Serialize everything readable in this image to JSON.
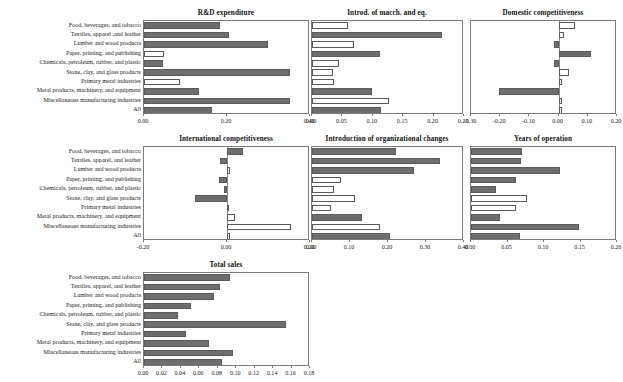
{
  "figure": {
    "categories": [
      "Food, beverages, and tobacco",
      "Textiles, apparel ,and leather",
      "Lumber and wood products",
      "Paper, printing, and publishing",
      "Chemicals, petroleum, rubber, and plastic",
      "Stone, clay, and glass products",
      "Primary metal industries",
      "Metal products, machinery, and equipment",
      "Miscellaneous manufacturing industries",
      "All"
    ],
    "categories_alt": [
      "Food, beverages, and tobacco",
      "Textiles, apparel, and leather",
      "Lumber and wood products",
      "Paper, printing, and publishing",
      "Chemicals, petroleum, rubber, and plastic",
      "Stone, clay, and glass products",
      "Primary metal industries",
      "Metal products, machinery, and equipment",
      "Miscellaneous manufacturing industries",
      "All"
    ],
    "colors": {
      "filled": "#6e6e6e",
      "hollow": "#ffffff",
      "outline": "#5a5a5a",
      "axis": "#7a7a7a",
      "text": "#1a1a1a"
    }
  },
  "chart_data": [
    {
      "id": "rd-expenditure",
      "type": "bar",
      "orientation": "horizontal",
      "title": "R&D expenditure",
      "xlabel": "",
      "ylabel": "",
      "xlim": [
        0.0,
        0.4
      ],
      "ticks": [
        "0.00",
        "0.20",
        "0.40"
      ],
      "tickvals": [
        0.0,
        0.2,
        0.4
      ],
      "grid": false,
      "categories": [
        "Food, beverages, and tobacco",
        "Textiles, apparel ,and leather",
        "Lumber and wood products",
        "Paper, printing, and publishing",
        "Chemicals, petroleum, rubber, and plastic",
        "Stone, clay, and glass products",
        "Primary metal industries",
        "Metal products, machinery, and equipment",
        "Miscellaneous manufacturing industries",
        "All"
      ],
      "values": [
        0.182,
        0.205,
        0.298,
        0.048,
        0.046,
        0.352,
        0.087,
        0.132,
        0.351,
        0.165
      ],
      "filled": [
        true,
        true,
        true,
        false,
        true,
        true,
        false,
        true,
        true,
        true
      ]
    },
    {
      "id": "introd-macch-eq",
      "type": "bar",
      "orientation": "horizontal",
      "title": "Introd. of macch. and eq.",
      "xlabel": "",
      "ylabel": "",
      "xlim": [
        0.0,
        0.25
      ],
      "ticks": [
        "0.00",
        "0.05",
        "0.10",
        "0.15",
        "0.20",
        "0.25"
      ],
      "tickvals": [
        0.0,
        0.05,
        0.1,
        0.15,
        0.2,
        0.25
      ],
      "grid": false,
      "categories": [
        "Food, beverages, and tobacco",
        "Textiles, apparel ,and leather",
        "Lumber and wood products",
        "Paper, printing, and publishing",
        "Chemicals, petroleum, rubber, and plastic",
        "Stone, clay, and glass products",
        "Primary metal industries",
        "Metal products, machinery, and equipment",
        "Miscellaneous manufacturing industries",
        "All"
      ],
      "values": [
        0.06,
        0.214,
        0.069,
        0.112,
        0.044,
        0.034,
        0.036,
        0.099,
        0.126,
        0.113
      ],
      "filled": [
        false,
        true,
        false,
        true,
        false,
        false,
        false,
        true,
        false,
        true
      ]
    },
    {
      "id": "domestic-competitiveness",
      "type": "bar",
      "orientation": "horizontal",
      "title": "Domestic competitiveness",
      "xlabel": "",
      "ylabel": "",
      "xlim": [
        -0.3,
        0.2
      ],
      "ticks": [
        "-0.30",
        "-0.20",
        "-0.10",
        "0.00",
        "0.10",
        "0.20"
      ],
      "tickvals": [
        -0.3,
        -0.2,
        -0.1,
        0.0,
        0.1,
        0.2
      ],
      "grid": false,
      "categories": [
        "Food, beverages, and tobacco",
        "Textiles, apparel ,and leather",
        "Lumber and wood products",
        "Paper, printing, and publishing",
        "Chemicals, petroleum, rubber, and plastic",
        "Stone, clay, and glass products",
        "Primary metal industries",
        "Metal products, machinery, and equipment",
        "Miscellaneous manufacturing industries",
        "All"
      ],
      "values": [
        0.056,
        0.02,
        -0.016,
        0.11,
        -0.016,
        0.035,
        0.01,
        -0.205,
        0.01,
        0.01
      ],
      "filled": [
        false,
        false,
        true,
        true,
        true,
        false,
        false,
        true,
        false,
        false
      ]
    },
    {
      "id": "international-competitiveness",
      "type": "bar",
      "orientation": "horizontal",
      "title": "International competitiveness",
      "xlabel": "",
      "ylabel": "",
      "xlim": [
        -0.2,
        0.2
      ],
      "ticks": [
        "-0.20",
        "0.00",
        "0.20"
      ],
      "tickvals": [
        -0.2,
        0.0,
        0.2
      ],
      "grid": false,
      "categories": [
        "Food, beverages, and tobacco",
        "Textiles, apparel, and leather",
        "Lumber and wood products",
        "Paper, printing, and publishing",
        "Chemicals, petroleum, rubber, and plastic",
        "Stone, clay, and glass products",
        "Primary metal industries",
        "Metal products, machinery, and equipment",
        "Miscellaneous manufacturing industries",
        "All"
      ],
      "values": [
        0.038,
        -0.018,
        0.008,
        -0.02,
        -0.008,
        -0.076,
        0.006,
        0.02,
        0.155,
        0.008
      ],
      "filled": [
        true,
        true,
        false,
        true,
        true,
        true,
        false,
        false,
        false,
        false
      ]
    },
    {
      "id": "organizational-changes",
      "type": "bar",
      "orientation": "horizontal",
      "title": "Introduction of organizational changes",
      "xlabel": "",
      "ylabel": "",
      "xlim": [
        0.0,
        0.4
      ],
      "ticks": [
        "0.00",
        "0.10",
        "0.20",
        "0.30",
        "0.40"
      ],
      "tickvals": [
        0.0,
        0.1,
        0.2,
        0.3,
        0.4
      ],
      "grid": false,
      "categories": [
        "Food, beverages, and tobacco",
        "Textiles, apparel, and leather",
        "Lumber and wood products",
        "Paper, printing, and publishing",
        "Chemicals, petroleum, rubber, and plastic",
        "Stone, clay, and glass products",
        "Primary metal industries",
        "Metal products, machinery, and equipment",
        "Miscellaneous manufacturing industries",
        "All"
      ],
      "values": [
        0.222,
        0.337,
        0.268,
        0.077,
        0.059,
        0.113,
        0.05,
        0.132,
        0.178,
        0.205
      ],
      "filled": [
        true,
        true,
        true,
        false,
        false,
        false,
        false,
        true,
        false,
        true
      ]
    },
    {
      "id": "years-of-operation",
      "type": "bar",
      "orientation": "horizontal",
      "title": "Years of operation",
      "xlabel": "",
      "ylabel": "",
      "xlim": [
        0.0,
        0.2
      ],
      "ticks": [
        "0.00",
        "0.05",
        "0.10",
        "0.15",
        "0.20"
      ],
      "tickvals": [
        0.0,
        0.05,
        0.1,
        0.15,
        0.2
      ],
      "grid": false,
      "categories": [
        "Food, beverages, and tobacco",
        "Textiles, apparel, and leather",
        "Lumber and wood products",
        "Paper, printing, and publishing",
        "Chemicals, petroleum, rubber, and plastic",
        "Stone, clay, and glass products",
        "Primary metal industries",
        "Metal products, machinery, and equipment",
        "Miscellaneous manufacturing industries",
        "All"
      ],
      "values": [
        0.07,
        0.068,
        0.122,
        0.062,
        0.034,
        0.077,
        0.062,
        0.04,
        0.148,
        0.067
      ],
      "filled": [
        true,
        true,
        true,
        true,
        true,
        false,
        false,
        true,
        true,
        true
      ]
    },
    {
      "id": "total-sales",
      "type": "bar",
      "orientation": "horizontal",
      "title": "Total sales",
      "xlabel": "",
      "ylabel": "",
      "xlim": [
        0.0,
        0.18
      ],
      "ticks": [
        "0.00",
        "0.02",
        "0.04",
        "0.06",
        "0.08",
        "0.10",
        "0.12",
        "0.14",
        "0.16",
        "0.18"
      ],
      "tickvals": [
        0.0,
        0.02,
        0.04,
        0.06,
        0.08,
        0.1,
        0.12,
        0.14,
        0.16,
        0.18
      ],
      "grid": false,
      "categories": [
        "Food, beverages, and tobacco",
        "Textiles, apparel, and leather",
        "Lumber and wood products",
        "Paper, printing, and publishing",
        "Chemicals, petroleum, rubber, and plastic",
        "Stone, clay, and glass products",
        "Primary metal industries",
        "Metal products, machinery, and equipment",
        "Miscellaneous manufacturing industries",
        "All"
      ],
      "values": [
        0.093,
        0.082,
        0.076,
        0.051,
        0.037,
        0.154,
        0.045,
        0.071,
        0.096,
        0.085
      ],
      "filled": [
        true,
        true,
        true,
        true,
        true,
        true,
        true,
        true,
        true,
        true
      ]
    }
  ],
  "layout": [
    {
      "id": "rd-expenditure",
      "plot": {
        "x": 143,
        "y": 20,
        "w": 166,
        "h": 94
      },
      "labels_right": 141,
      "show_labels": true
    },
    {
      "id": "introd-macch-eq",
      "plot": {
        "x": 311,
        "y": 20,
        "w": 152,
        "h": 94
      },
      "labels_right": null,
      "show_labels": false
    },
    {
      "id": "domestic-competitiveness",
      "plot": {
        "x": 470,
        "y": 20,
        "w": 146,
        "h": 94
      },
      "labels_right": null,
      "show_labels": false
    },
    {
      "id": "international-competitiveness",
      "plot": {
        "x": 143,
        "y": 146,
        "w": 166,
        "h": 94
      },
      "labels_right": 141,
      "show_labels": true
    },
    {
      "id": "organizational-changes",
      "plot": {
        "x": 311,
        "y": 146,
        "w": 152,
        "h": 94
      },
      "labels_right": null,
      "show_labels": false
    },
    {
      "id": "years-of-operation",
      "plot": {
        "x": 470,
        "y": 146,
        "w": 146,
        "h": 94
      },
      "labels_right": null,
      "show_labels": false
    },
    {
      "id": "total-sales",
      "plot": {
        "x": 143,
        "y": 272,
        "w": 166,
        "h": 94
      },
      "labels_right": 141,
      "show_labels": true
    }
  ]
}
